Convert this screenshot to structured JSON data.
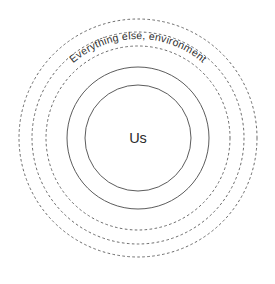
{
  "diagram": {
    "type": "concentric-circles",
    "background_color": "#ffffff",
    "center": {
      "x": 138,
      "y": 138
    },
    "center_label": "Us",
    "outer_label": "Everything else, environment",
    "rings": [
      {
        "name": "ring-inner-core",
        "radius": 53,
        "style": "solid",
        "color": "#4a4a4a"
      },
      {
        "name": "ring-second",
        "radius": 71,
        "style": "solid",
        "color": "#4a4a4a"
      },
      {
        "name": "ring-third",
        "radius": 92,
        "style": "dashed",
        "color": "#5a5a5a"
      },
      {
        "name": "ring-fourth",
        "radius": 106,
        "style": "dashed",
        "color": "#5a5a5a"
      },
      {
        "name": "ring-outer",
        "radius": 119,
        "style": "dashed",
        "color": "#5a5a5a"
      }
    ],
    "label_arc_radius": 99
  }
}
